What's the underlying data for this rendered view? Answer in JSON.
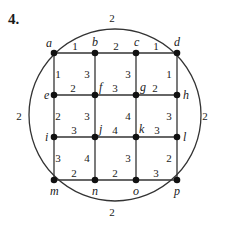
{
  "problem_number": "4.",
  "colors": {
    "edge": "#333333",
    "node": "#111111",
    "text": "#1a1a1a",
    "background": "#ffffff"
  },
  "nodes": [
    {
      "id": "a",
      "label": "a",
      "x": 54,
      "y": 53,
      "lx": 46,
      "ly": 47
    },
    {
      "id": "b",
      "label": "b",
      "x": 95,
      "y": 53,
      "lx": 92,
      "ly": 46
    },
    {
      "id": "c",
      "label": "c",
      "x": 136,
      "y": 53,
      "lx": 134,
      "ly": 46
    },
    {
      "id": "d",
      "label": "d",
      "x": 177,
      "y": 53,
      "lx": 174,
      "ly": 46
    },
    {
      "id": "e",
      "label": "e",
      "x": 54,
      "y": 95,
      "lx": 44,
      "ly": 99
    },
    {
      "id": "f",
      "label": "f",
      "x": 95,
      "y": 95,
      "lx": 99,
      "ly": 91
    },
    {
      "id": "g",
      "label": "g",
      "x": 136,
      "y": 95,
      "lx": 140,
      "ly": 91
    },
    {
      "id": "h",
      "label": "h",
      "x": 177,
      "y": 95,
      "lx": 183,
      "ly": 99
    },
    {
      "id": "i",
      "label": "i",
      "x": 54,
      "y": 137,
      "lx": 45,
      "ly": 141
    },
    {
      "id": "j",
      "label": "j",
      "x": 95,
      "y": 137,
      "lx": 99,
      "ly": 133
    },
    {
      "id": "k",
      "label": "k",
      "x": 136,
      "y": 137,
      "lx": 139,
      "ly": 133
    },
    {
      "id": "l",
      "label": "l",
      "x": 177,
      "y": 137,
      "lx": 183,
      "ly": 141
    },
    {
      "id": "m",
      "label": "m",
      "x": 54,
      "y": 180,
      "lx": 50,
      "ly": 195
    },
    {
      "id": "n",
      "label": "n",
      "x": 95,
      "y": 180,
      "lx": 92,
      "ly": 195
    },
    {
      "id": "o",
      "label": "o",
      "x": 136,
      "y": 180,
      "lx": 133,
      "ly": 195
    },
    {
      "id": "p",
      "label": "p",
      "x": 177,
      "y": 180,
      "lx": 174,
      "ly": 195
    }
  ],
  "edges": [
    {
      "from": "a",
      "to": "b",
      "weight": "1",
      "wx": 75,
      "wy": 50
    },
    {
      "from": "b",
      "to": "c",
      "weight": "2",
      "wx": 116,
      "wy": 50
    },
    {
      "from": "c",
      "to": "d",
      "weight": "1",
      "wx": 156,
      "wy": 50
    },
    {
      "from": "e",
      "to": "f",
      "weight": "2",
      "wx": 73,
      "wy": 92
    },
    {
      "from": "f",
      "to": "g",
      "weight": "3",
      "wx": 115,
      "wy": 92
    },
    {
      "from": "g",
      "to": "h",
      "weight": "2",
      "wx": 155,
      "wy": 92
    },
    {
      "from": "i",
      "to": "j",
      "weight": "3",
      "wx": 74,
      "wy": 134
    },
    {
      "from": "j",
      "to": "k",
      "weight": "4",
      "wx": 115,
      "wy": 134
    },
    {
      "from": "k",
      "to": "l",
      "weight": "3",
      "wx": 157,
      "wy": 134
    },
    {
      "from": "m",
      "to": "n",
      "weight": "2",
      "wx": 74,
      "wy": 177
    },
    {
      "from": "n",
      "to": "o",
      "weight": "2",
      "wx": 115,
      "wy": 177
    },
    {
      "from": "o",
      "to": "p",
      "weight": "3",
      "wx": 156,
      "wy": 177
    },
    {
      "from": "a",
      "to": "e",
      "weight": "1",
      "wx": 58,
      "wy": 78
    },
    {
      "from": "e",
      "to": "i",
      "weight": "2",
      "wx": 58,
      "wy": 120
    },
    {
      "from": "i",
      "to": "m",
      "weight": "3",
      "wx": 58,
      "wy": 162
    },
    {
      "from": "b",
      "to": "f",
      "weight": "3",
      "wx": 87,
      "wy": 78
    },
    {
      "from": "f",
      "to": "j",
      "weight": "3",
      "wx": 87,
      "wy": 120
    },
    {
      "from": "j",
      "to": "n",
      "weight": "4",
      "wx": 87,
      "wy": 162
    },
    {
      "from": "c",
      "to": "g",
      "weight": "3",
      "wx": 128,
      "wy": 78
    },
    {
      "from": "g",
      "to": "k",
      "weight": "4",
      "wx": 128,
      "wy": 120
    },
    {
      "from": "k",
      "to": "o",
      "weight": "3",
      "wx": 128,
      "wy": 162
    },
    {
      "from": "d",
      "to": "h",
      "weight": "1",
      "wx": 169,
      "wy": 78
    },
    {
      "from": "h",
      "to": "l",
      "weight": "3",
      "wx": 169,
      "wy": 120
    },
    {
      "from": "l",
      "to": "p",
      "weight": "2",
      "wx": 169,
      "wy": 162
    }
  ],
  "arc_edges": [
    {
      "from": "a",
      "to": "d",
      "weight": "2",
      "wx": 112,
      "wy": 22
    },
    {
      "from": "d",
      "to": "p",
      "weight": "2",
      "wx": 205,
      "wy": 120
    },
    {
      "from": "p",
      "to": "m",
      "weight": "2",
      "wx": 112,
      "wy": 216
    },
    {
      "from": "m",
      "to": "a",
      "weight": "2",
      "wx": 19,
      "wy": 120
    }
  ],
  "circle": {
    "cx": 115,
    "cy": 115,
    "r": 86
  }
}
